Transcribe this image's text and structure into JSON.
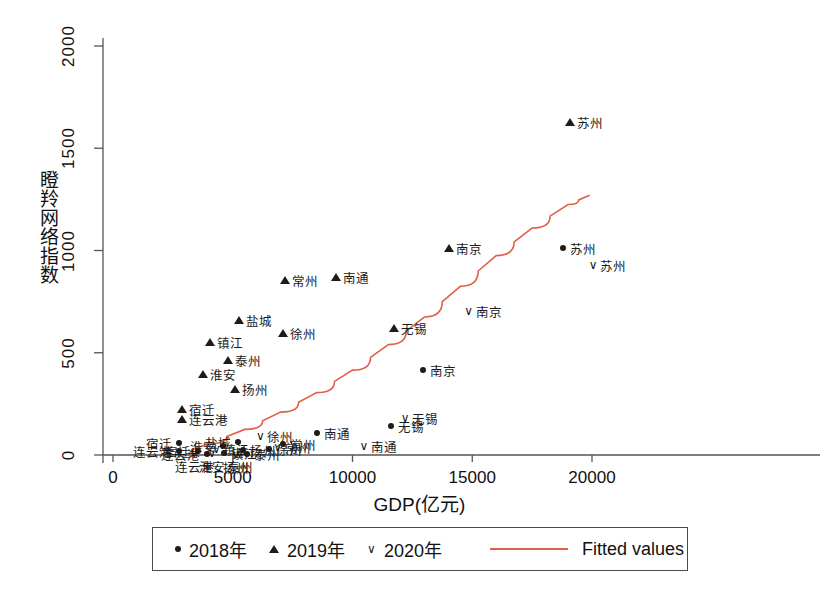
{
  "chart_data": {
    "type": "scatter",
    "title": "",
    "xlabel": "GDP(亿元)",
    "ylabel": "瞪羚网络指数",
    "xlim": [
      0,
      21000
    ],
    "ylim": [
      0,
      2100
    ],
    "xticks": [
      0,
      5000,
      10000,
      15000,
      20000
    ],
    "xtick_labels": [
      "0",
      "5000",
      "10000",
      "15000",
      "20000"
    ],
    "yticks": [
      0,
      500,
      1000,
      1500,
      2000
    ],
    "ytick_labels": [
      "0",
      "500",
      "1000",
      "1500",
      "2000"
    ],
    "grid": false,
    "legend_position": "bottom",
    "legend": [
      {
        "label": "2018年",
        "marker": "dot"
      },
      {
        "label": "2019年",
        "marker": "triangle"
      },
      {
        "label": "2020年",
        "marker": "check"
      },
      {
        "label": "Fitted values",
        "marker": "line",
        "color": "#E2604A"
      }
    ],
    "series": [
      {
        "name": "2018年",
        "marker": "dot",
        "points": [
          {
            "label": "宿迁",
            "x": 2755,
            "y": 60,
            "lpos": "left"
          },
          {
            "label": "宿迁",
            "x": 3560,
            "y": 20,
            "lpos": "left"
          },
          {
            "label": "连云港",
            "x": 2760,
            "y": 18,
            "lpos": "left"
          },
          {
            "label": "连云港",
            "x": 3930,
            "y": 5,
            "lpos": "left"
          },
          {
            "label": "淮安",
            "x": 4580,
            "y": 45,
            "lpos": "left"
          },
          {
            "label": "镇江",
            "x": 4630,
            "y": 10,
            "lpos": "right"
          },
          {
            "label": "盐城",
            "x": 5230,
            "y": 65,
            "lpos": "left"
          },
          {
            "label": "扬州",
            "x": 5420,
            "y": 25,
            "lpos": "right"
          },
          {
            "label": "泰州",
            "x": 5600,
            "y": 3,
            "lpos": "right"
          },
          {
            "label": "徐州",
            "x": 6530,
            "y": 30,
            "lpos": "right"
          },
          {
            "label": "常州",
            "x": 7100,
            "y": 55,
            "lpos": "right"
          },
          {
            "label": "南通",
            "x": 8500,
            "y": 110,
            "lpos": "right"
          },
          {
            "label": "无锡",
            "x": 11600,
            "y": 140,
            "lpos": "right"
          },
          {
            "label": "南京",
            "x": 12950,
            "y": 415,
            "lpos": "right"
          },
          {
            "label": "苏州",
            "x": 18800,
            "y": 1010,
            "lpos": "right"
          }
        ]
      },
      {
        "name": "2019年",
        "marker": "triangle",
        "points": [
          {
            "label": "宿迁",
            "x": 2870,
            "y": 225,
            "lpos": "right"
          },
          {
            "label": "连云港",
            "x": 2880,
            "y": 175,
            "lpos": "right"
          },
          {
            "label": "淮安",
            "x": 3760,
            "y": 395,
            "lpos": "right"
          },
          {
            "label": "镇江",
            "x": 4040,
            "y": 555,
            "lpos": "right"
          },
          {
            "label": "泰州",
            "x": 4810,
            "y": 465,
            "lpos": "right"
          },
          {
            "label": "扬州",
            "x": 5090,
            "y": 325,
            "lpos": "right"
          },
          {
            "label": "盐城",
            "x": 5250,
            "y": 660,
            "lpos": "right"
          },
          {
            "label": "徐州",
            "x": 7080,
            "y": 595,
            "lpos": "right"
          },
          {
            "label": "常州",
            "x": 7190,
            "y": 855,
            "lpos": "right"
          },
          {
            "label": "南通",
            "x": 9300,
            "y": 870,
            "lpos": "right"
          },
          {
            "label": "无锡",
            "x": 11730,
            "y": 620,
            "lpos": "right"
          },
          {
            "label": "南京",
            "x": 14050,
            "y": 1010,
            "lpos": "right"
          },
          {
            "label": "苏州",
            "x": 19100,
            "y": 1630,
            "lpos": "right"
          }
        ]
      },
      {
        "name": "2020年",
        "marker": "check",
        "points": [
          {
            "label": "连云港",
            "x": 3390,
            "y": 10,
            "lpos": "below"
          },
          {
            "label": "淮安",
            "x": 4130,
            "y": 8,
            "lpos": "below"
          },
          {
            "label": "镇江",
            "x": 4320,
            "y": 30,
            "lpos": "right"
          },
          {
            "label": "扬州",
            "x": 5120,
            "y": 3,
            "lpos": "below"
          },
          {
            "label": "泰州",
            "x": 5290,
            "y": 12,
            "lpos": "below"
          },
          {
            "label": "常州",
            "x": 6880,
            "y": 38,
            "lpos": "right"
          },
          {
            "label": "徐州",
            "x": 6150,
            "y": 95,
            "lpos": "right"
          },
          {
            "label": "南通",
            "x": 10480,
            "y": 45,
            "lpos": "right"
          },
          {
            "label": "无锡",
            "x": 12200,
            "y": 180,
            "lpos": "right"
          },
          {
            "label": "南京",
            "x": 14850,
            "y": 705,
            "lpos": "right"
          },
          {
            "label": "苏州",
            "x": 20050,
            "y": 930,
            "lpos": "right"
          }
        ]
      }
    ],
    "fitted_line": {
      "name": "Fitted values",
      "color": "#E2604A",
      "points": [
        {
          "x": 2600,
          "y": 0
        },
        {
          "x": 4000,
          "y": 55
        },
        {
          "x": 5500,
          "y": 125
        },
        {
          "x": 7000,
          "y": 210
        },
        {
          "x": 8500,
          "y": 305
        },
        {
          "x": 10000,
          "y": 415
        },
        {
          "x": 11500,
          "y": 540
        },
        {
          "x": 13000,
          "y": 675
        },
        {
          "x": 14500,
          "y": 825
        },
        {
          "x": 16000,
          "y": 975
        },
        {
          "x": 17500,
          "y": 1110
        },
        {
          "x": 19000,
          "y": 1225
        },
        {
          "x": 19900,
          "y": 1270
        }
      ]
    }
  }
}
